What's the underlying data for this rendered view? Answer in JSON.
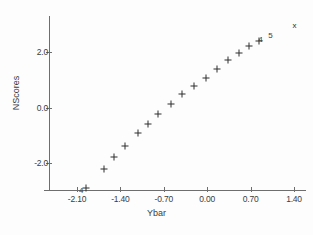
{
  "chart_data": {
    "type": "scatter",
    "title": "",
    "xlabel": "Ybar",
    "ylabel": "NScores",
    "xlim": [
      -2.45,
      1.75
    ],
    "ylim": [
      -3.4,
      3.4
    ],
    "grid": false,
    "legend": null,
    "x_ticks": [
      "-2.10",
      "-1.40",
      "-0.70",
      "0.00",
      "0.70",
      "1.40"
    ],
    "x_tick_values": [
      -2.1,
      -1.4,
      -0.7,
      0.0,
      0.7,
      1.4
    ],
    "y_ticks": [
      "2.0",
      "0.0",
      "-2.0"
    ],
    "y_tick_values": [
      2.0,
      0.0,
      -2.0
    ],
    "marker": "plus",
    "points": [
      {
        "x": -1.96,
        "y": -2.9,
        "marker": "plus"
      },
      {
        "x": -1.66,
        "y": -2.22,
        "marker": "plus"
      },
      {
        "x": -1.5,
        "y": -1.8,
        "marker": "plus"
      },
      {
        "x": -1.33,
        "y": -1.38,
        "marker": "plus"
      },
      {
        "x": -1.12,
        "y": -0.93,
        "marker": "plus"
      },
      {
        "x": -0.95,
        "y": -0.58,
        "marker": "plus"
      },
      {
        "x": -0.8,
        "y": -0.24,
        "marker": "plus"
      },
      {
        "x": -0.58,
        "y": 0.13,
        "marker": "plus"
      },
      {
        "x": -0.4,
        "y": 0.47,
        "marker": "plus"
      },
      {
        "x": -0.22,
        "y": 0.77,
        "marker": "plus"
      },
      {
        "x": -0.02,
        "y": 1.08,
        "marker": "plus"
      },
      {
        "x": 0.16,
        "y": 1.4,
        "marker": "plus"
      },
      {
        "x": 0.33,
        "y": 1.7,
        "marker": "plus"
      },
      {
        "x": 0.52,
        "y": 1.97,
        "marker": "plus"
      },
      {
        "x": 0.68,
        "y": 2.22,
        "marker": "plus"
      },
      {
        "x": 0.84,
        "y": 2.38,
        "marker": "plus"
      },
      {
        "x": 1.41,
        "y": 2.95,
        "marker": "x"
      }
    ],
    "annotations": [
      {
        "text": "4",
        "x": -2.03,
        "y": -3.02
      },
      {
        "text": "4",
        "x": 0.86,
        "y": 2.42
      },
      {
        "text": "5",
        "x": 1.02,
        "y": 2.56
      }
    ]
  }
}
